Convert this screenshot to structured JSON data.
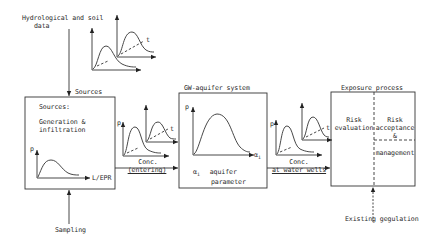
{
  "diagram": {
    "inputs": {
      "hydrological_line1": "Hydrological and soil",
      "hydrological_line2": "data",
      "sampling": "Sampling",
      "existing_regulation": "Existing gegulation"
    },
    "arrows": {
      "sources_label": "Sources",
      "conc_entering_line1": "Conc.",
      "conc_entering_line2": "(entering)",
      "conc_wells_line1": "Conc.",
      "conc_wells_line2": "at water wells"
    },
    "boxes": {
      "sources": {
        "title": "Sources:",
        "line1": "Generation &",
        "line2": "infiltration",
        "y_axis": "p",
        "x_axis": "L/EPR"
      },
      "gw_aquifer": {
        "caption": "GW-aquifer system",
        "y_axis": "p",
        "x_axis": "α",
        "x_axis_sub": "i",
        "param_symbol": "α",
        "param_sub": "i",
        "param_line1": "aquifer",
        "param_line2": "parameter"
      },
      "exposure": {
        "caption": "Exposure process",
        "left_line1": "Risk",
        "left_line2": "evaluation",
        "right_line1": "Risk",
        "right_line2": "acceptance",
        "right_line3": "&",
        "right_line4": "management"
      }
    },
    "mini_plots": {
      "y_axis": "p",
      "time_axis": "t"
    }
  }
}
